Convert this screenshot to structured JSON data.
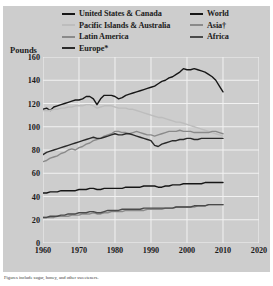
{
  "figure": {
    "unit_label": "Pounds",
    "footnote": "Figures include sugar, honey, and other sweeteners.",
    "background": "#cdcdcd",
    "grid_color": "#f2f2f2"
  },
  "legend": {
    "left": [
      {
        "label": "United States & Canada",
        "color": "#161616",
        "key": "us_canada"
      },
      {
        "label": "Pacific Islands & Australia",
        "color": "#bdbdbd",
        "key": "pacific_australia"
      },
      {
        "label": "Latin America",
        "color": "#8a8a8a",
        "key": "latin_america"
      },
      {
        "label": "Europe*",
        "color": "#2a2a2a",
        "key": "europe"
      }
    ],
    "right": [
      {
        "label": "World",
        "color": "#161616",
        "key": "world"
      },
      {
        "label": "Asia†",
        "color": "#8a8a8a",
        "key": "asia"
      },
      {
        "label": "Africa",
        "color": "#4a4a4a",
        "key": "africa"
      }
    ]
  },
  "chart_data": {
    "type": "line",
    "title": "",
    "subtitle": "",
    "xlabel": "",
    "ylabel": "Pounds",
    "xlim": [
      1960,
      2020
    ],
    "ylim": [
      0,
      160
    ],
    "xticks": [
      1960,
      1970,
      1980,
      1990,
      2000,
      2010,
      2020
    ],
    "yticks": [
      0,
      20,
      40,
      60,
      80,
      100,
      120,
      140,
      160
    ],
    "grid": true,
    "legend_position": "top",
    "annotations": [
      "Figures include sugar, honey, and other sweeteners."
    ],
    "x": [
      1960,
      1961,
      1962,
      1963,
      1964,
      1965,
      1966,
      1967,
      1968,
      1969,
      1970,
      1971,
      1972,
      1973,
      1974,
      1975,
      1976,
      1977,
      1978,
      1979,
      1980,
      1981,
      1982,
      1983,
      1984,
      1985,
      1986,
      1987,
      1988,
      1989,
      1990,
      1991,
      1992,
      1993,
      1994,
      1995,
      1996,
      1997,
      1998,
      1999,
      2000,
      2001,
      2002,
      2003,
      2004,
      2005,
      2006,
      2007,
      2008,
      2009,
      2010
    ],
    "series": [
      {
        "name": "United States & Canada",
        "color": "#161616",
        "values": [
          115,
          116,
          114,
          117,
          118,
          119,
          120,
          121,
          122,
          123,
          123,
          124,
          126,
          126,
          124,
          119,
          124,
          127,
          127,
          127,
          126,
          124,
          125,
          127,
          128,
          129,
          130,
          131,
          132,
          133,
          134,
          135,
          137,
          139,
          140,
          142,
          143,
          145,
          147,
          150,
          149,
          149,
          150,
          149,
          148,
          147,
          145,
          143,
          140,
          135,
          130
        ]
      },
      {
        "name": "Pacific Islands & Australia",
        "color": "#bdbdbd",
        "values": [
          114,
          114,
          114,
          115,
          115,
          116,
          116,
          117,
          117,
          118,
          118,
          118,
          119,
          119,
          118,
          116,
          117,
          118,
          118,
          118,
          117,
          116,
          116,
          116,
          115,
          115,
          114,
          113,
          112,
          111,
          110,
          109,
          108,
          108,
          107,
          106,
          105,
          104,
          104,
          103,
          102,
          101,
          100,
          99,
          98,
          97,
          96,
          95,
          94,
          93,
          92
        ]
      },
      {
        "name": "Latin America",
        "color": "#8a8a8a",
        "values": [
          70,
          71,
          73,
          74,
          75,
          77,
          78,
          80,
          81,
          80,
          82,
          83,
          85,
          86,
          88,
          89,
          90,
          92,
          93,
          94,
          96,
          96,
          95,
          95,
          94,
          95,
          96,
          95,
          94,
          93,
          93,
          92,
          93,
          94,
          95,
          96,
          96,
          96,
          97,
          96,
          96,
          96,
          95,
          95,
          95,
          95,
          95,
          96,
          96,
          95,
          94
        ]
      },
      {
        "name": "Europe*",
        "color": "#2a2a2a",
        "values": [
          76,
          78,
          79,
          80,
          81,
          82,
          83,
          84,
          85,
          86,
          87,
          88,
          89,
          90,
          91,
          90,
          90,
          91,
          92,
          93,
          94,
          93,
          93,
          94,
          94,
          93,
          92,
          91,
          90,
          89,
          88,
          84,
          83,
          85,
          86,
          87,
          88,
          88,
          89,
          89,
          90,
          90,
          89,
          89,
          90,
          90,
          90,
          90,
          90,
          90,
          90
        ]
      },
      {
        "name": "World",
        "color": "#161616",
        "values": [
          43,
          43,
          44,
          44,
          44,
          45,
          45,
          45,
          45,
          45,
          46,
          46,
          46,
          47,
          47,
          46,
          46,
          47,
          47,
          47,
          47,
          47,
          47,
          48,
          48,
          48,
          48,
          48,
          49,
          49,
          49,
          49,
          48,
          48,
          49,
          49,
          50,
          50,
          50,
          51,
          51,
          51,
          51,
          51,
          51,
          52,
          52,
          52,
          52,
          52,
          52
        ]
      },
      {
        "name": "Asia†",
        "color": "#8a8a8a",
        "values": [
          22,
          22,
          22,
          22,
          23,
          23,
          23,
          23,
          24,
          24,
          24,
          25,
          25,
          25,
          26,
          25,
          25,
          26,
          26,
          27,
          27,
          27,
          27,
          28,
          28,
          28,
          28,
          28,
          28,
          29,
          29,
          29,
          29,
          29,
          30,
          30,
          30,
          31,
          31,
          31,
          31,
          31,
          31,
          32,
          32,
          32,
          33,
          33,
          33,
          33,
          33
        ]
      },
      {
        "name": "Africa",
        "color": "#4a4a4a",
        "values": [
          22,
          22,
          23,
          23,
          23,
          24,
          24,
          25,
          25,
          25,
          26,
          26,
          26,
          27,
          27,
          26,
          26,
          27,
          28,
          28,
          28,
          28,
          29,
          29,
          29,
          29,
          29,
          29,
          30,
          30,
          30,
          30,
          30,
          30,
          30,
          30,
          30,
          31,
          31,
          31,
          31,
          31,
          32,
          32,
          32,
          32,
          33,
          33,
          33,
          33,
          33
        ]
      }
    ]
  }
}
